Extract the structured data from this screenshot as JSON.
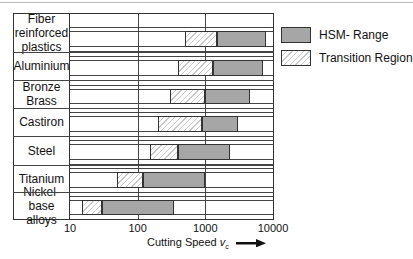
{
  "chart_data": {
    "type": "bar",
    "subtype": "floating-range-bar (log x)",
    "title": "",
    "xlabel": "Cutting Speed v_c",
    "xlabel_main": "Cutting Speed ",
    "xlabel_var": "v",
    "xlabel_sub": "c",
    "ylabel": "",
    "xscale": "log",
    "xlim": [
      10,
      10000
    ],
    "x_ticks": [
      "10",
      "100",
      "1000",
      "10000"
    ],
    "grid": "vertical at decades",
    "legend_position": "right",
    "legend": [
      {
        "name": "HSM- Range",
        "pattern": "dotted-gray"
      },
      {
        "name": "Transition Region",
        "pattern": "hatched"
      }
    ],
    "categories": [
      "Fiber reinforced plastics",
      "Aluminium",
      "Bronze Brass",
      "Castiron",
      "Steel",
      "Titanium",
      "Nickel-base alloys"
    ],
    "category_lines": [
      [
        "Fiber",
        "reinforced",
        "plastics"
      ],
      [
        "Aluminium"
      ],
      [
        "Bronze",
        "Brass"
      ],
      [
        "Castiron"
      ],
      [
        "Steel"
      ],
      [
        "Titanium"
      ],
      [
        "Nickel-base",
        "alloys"
      ]
    ],
    "series": [
      {
        "name": "Transition Region",
        "ranges": [
          [
            500,
            1500
          ],
          [
            400,
            1300
          ],
          [
            300,
            1000
          ],
          [
            200,
            900
          ],
          [
            150,
            400
          ],
          [
            50,
            120
          ],
          [
            15,
            30
          ]
        ]
      },
      {
        "name": "HSM- Range",
        "ranges": [
          [
            1500,
            8000
          ],
          [
            1300,
            7000
          ],
          [
            1000,
            4500
          ],
          [
            900,
            3000
          ],
          [
            400,
            2300
          ],
          [
            120,
            1000
          ],
          [
            30,
            350
          ]
        ]
      }
    ]
  },
  "legend": {
    "hsm_label": "HSM- Range",
    "transition_label": "Transition Region"
  },
  "axis": {
    "ticks": [
      "10",
      "100",
      "1000",
      "10000"
    ],
    "label_main": "Cutting Speed ",
    "label_var": "v",
    "label_sub": "c"
  },
  "categories": [
    {
      "label": "Fiber reinforced plastics"
    },
    {
      "label": "Aluminium"
    },
    {
      "label": "Bronze Brass"
    },
    {
      "label": "Castiron"
    },
    {
      "label": "Steel"
    },
    {
      "label": "Titanium"
    },
    {
      "label": "Nickel-base alloys"
    }
  ]
}
